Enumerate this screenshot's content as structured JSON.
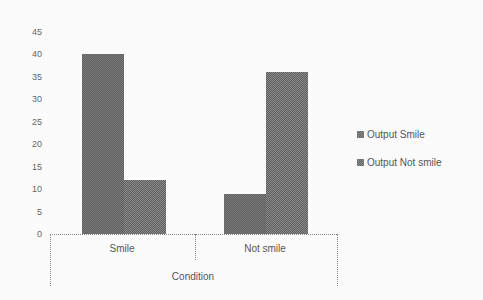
{
  "chart_data": {
    "type": "bar",
    "title": "",
    "xlabel": "Condition",
    "ylabel": "",
    "categories": [
      "Smile",
      "Not smile"
    ],
    "series": [
      {
        "name": "Output Smile",
        "values": [
          40,
          9
        ]
      },
      {
        "name": "Output Not smile",
        "values": [
          12,
          36
        ]
      }
    ],
    "ylim": [
      0,
      45
    ],
    "yticks": [
      "0",
      "5",
      "10",
      "15",
      "20",
      "25",
      "30",
      "35",
      "40",
      "45"
    ],
    "grid": false,
    "legend_position": "right"
  },
  "legend": {
    "items": [
      {
        "label": "Output Smile"
      },
      {
        "label": "Output Not smile"
      }
    ]
  },
  "axis": {
    "x_title": "Condition",
    "categories": [
      "Smile",
      "Not smile"
    ]
  }
}
